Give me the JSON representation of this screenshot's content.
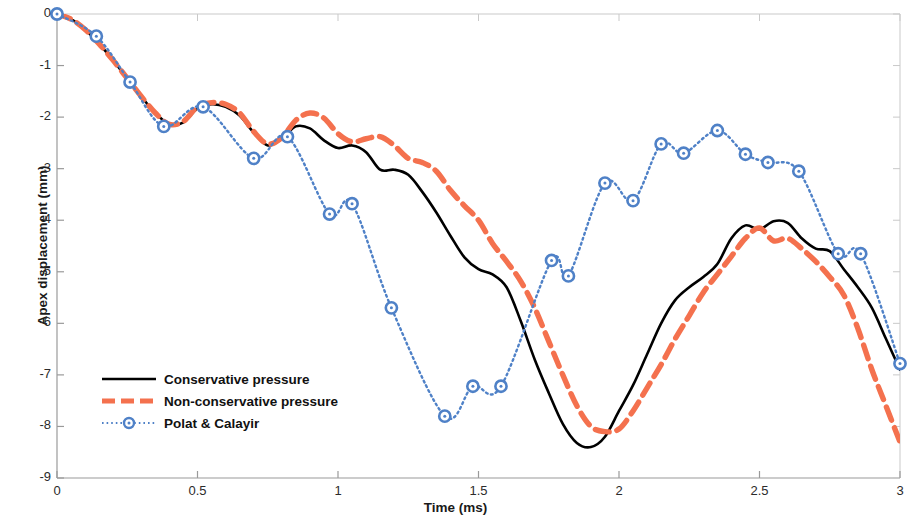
{
  "chart_data": {
    "type": "line",
    "title": "",
    "xlabel": "Time (ms)",
    "ylabel": "Apex displacement (mm)",
    "xlim": [
      0,
      3
    ],
    "ylim": [
      -9,
      0
    ],
    "xticks": [
      "0",
      "0.5",
      "1",
      "1.5",
      "2",
      "2.5",
      "3"
    ],
    "xtick_values": [
      0,
      0.5,
      1,
      1.5,
      2,
      2.5,
      3
    ],
    "yticks": [
      "0",
      "-1",
      "-2",
      "-3",
      "-4",
      "-5",
      "-6",
      "-7",
      "-8",
      "-9"
    ],
    "ytick_values": [
      0,
      -1,
      -2,
      -3,
      -4,
      -5,
      -6,
      -7,
      -8,
      -9
    ],
    "grid": false,
    "legend_position": "lower-left-inside",
    "series": [
      {
        "name": "Conservative pressure",
        "style": "solid",
        "color": "#000000",
        "marker": "none",
        "x": [
          0.0,
          0.05,
          0.1,
          0.15,
          0.2,
          0.25,
          0.3,
          0.35,
          0.4,
          0.45,
          0.5,
          0.55,
          0.6,
          0.65,
          0.7,
          0.75,
          0.8,
          0.85,
          0.9,
          0.95,
          1.0,
          1.05,
          1.1,
          1.15,
          1.2,
          1.25,
          1.3,
          1.35,
          1.4,
          1.45,
          1.5,
          1.55,
          1.6,
          1.65,
          1.7,
          1.75,
          1.8,
          1.85,
          1.9,
          1.95,
          2.0,
          2.05,
          2.1,
          2.15,
          2.2,
          2.25,
          2.3,
          2.35,
          2.4,
          2.45,
          2.5,
          2.55,
          2.6,
          2.65,
          2.7,
          2.75,
          2.8,
          2.85,
          2.9,
          2.95,
          3.0
        ],
        "y": [
          0.0,
          -0.1,
          -0.3,
          -0.58,
          -0.9,
          -1.25,
          -1.6,
          -1.92,
          -2.14,
          -2.1,
          -1.83,
          -1.75,
          -1.8,
          -1.97,
          -2.3,
          -2.55,
          -2.42,
          -2.18,
          -2.22,
          -2.45,
          -2.6,
          -2.55,
          -2.68,
          -3.02,
          -3.02,
          -3.12,
          -3.45,
          -3.85,
          -4.3,
          -4.72,
          -4.95,
          -5.05,
          -5.3,
          -5.95,
          -6.7,
          -7.35,
          -7.95,
          -8.32,
          -8.4,
          -8.2,
          -7.7,
          -7.2,
          -6.6,
          -6.0,
          -5.55,
          -5.3,
          -5.1,
          -4.85,
          -4.35,
          -4.1,
          -4.18,
          -4.02,
          -4.05,
          -4.35,
          -4.55,
          -4.6,
          -4.95,
          -5.3,
          -5.7,
          -6.3,
          -6.9
        ]
      },
      {
        "name": "Non-conservative pressure",
        "style": "dashed",
        "color": "#F4714E",
        "marker": "none",
        "x": [
          0.0,
          0.05,
          0.1,
          0.15,
          0.2,
          0.25,
          0.3,
          0.35,
          0.4,
          0.45,
          0.5,
          0.55,
          0.6,
          0.65,
          0.7,
          0.75,
          0.8,
          0.85,
          0.9,
          0.95,
          1.0,
          1.05,
          1.1,
          1.15,
          1.2,
          1.25,
          1.3,
          1.35,
          1.4,
          1.45,
          1.5,
          1.55,
          1.6,
          1.65,
          1.7,
          1.75,
          1.8,
          1.85,
          1.9,
          1.95,
          2.0,
          2.05,
          2.1,
          2.15,
          2.2,
          2.25,
          2.3,
          2.35,
          2.4,
          2.45,
          2.5,
          2.55,
          2.6,
          2.65,
          2.7,
          2.75,
          2.8,
          2.85,
          2.9,
          2.95,
          3.0
        ],
        "y": [
          0.0,
          -0.1,
          -0.3,
          -0.58,
          -0.9,
          -1.25,
          -1.6,
          -1.92,
          -2.14,
          -2.08,
          -1.8,
          -1.72,
          -1.75,
          -1.92,
          -2.28,
          -2.52,
          -2.4,
          -2.06,
          -1.92,
          -2.02,
          -2.32,
          -2.48,
          -2.42,
          -2.38,
          -2.55,
          -2.8,
          -2.88,
          -3.05,
          -3.42,
          -3.72,
          -4.0,
          -4.45,
          -4.8,
          -5.18,
          -5.7,
          -6.35,
          -7.0,
          -7.6,
          -8.0,
          -8.1,
          -8.05,
          -7.7,
          -7.25,
          -6.8,
          -6.3,
          -5.85,
          -5.4,
          -5.05,
          -4.7,
          -4.35,
          -4.15,
          -4.4,
          -4.35,
          -4.55,
          -4.8,
          -5.1,
          -5.45,
          -6.1,
          -6.9,
          -7.6,
          -8.3
        ]
      },
      {
        "name": "Polat & Calayir",
        "style": "dotted",
        "color": "#4F81C7",
        "marker": "circle",
        "x": [
          0.0,
          0.14,
          0.26,
          0.38,
          0.52,
          0.7,
          0.82,
          0.97,
          1.05,
          1.19,
          1.38,
          1.48,
          1.58,
          1.76,
          1.82,
          1.95,
          2.05,
          2.15,
          2.23,
          2.35,
          2.45,
          2.53,
          2.64,
          2.78,
          2.86,
          3.0
        ],
        "y": [
          0.0,
          -0.43,
          -1.32,
          -2.18,
          -1.8,
          -2.8,
          -2.38,
          -3.88,
          -3.68,
          -5.7,
          -7.8,
          -7.22,
          -7.22,
          -4.78,
          -5.08,
          -3.28,
          -3.62,
          -2.52,
          -2.7,
          -2.26,
          -2.72,
          -2.88,
          -3.05,
          -4.65,
          -4.65,
          -6.78
        ]
      }
    ]
  },
  "legend": {
    "items": [
      {
        "label": "Conservative pressure"
      },
      {
        "label": "Non-conservative pressure"
      },
      {
        "label": "Polat & Calayir"
      }
    ]
  },
  "colors": {
    "conservative": "#000000",
    "non_conservative": "#F4714E",
    "polat_calayir": "#4F81C7",
    "axis": "#9a9a9a",
    "text": "#1a1a1a",
    "background": "#ffffff"
  }
}
